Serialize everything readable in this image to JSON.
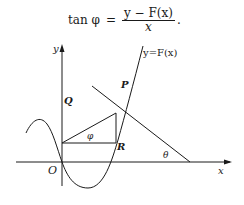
{
  "formula": {
    "lhs": "tan φ",
    "equals": "=",
    "numerator": "y − F(x)",
    "denominator": "x",
    "trailing": "."
  },
  "figure": {
    "axis_labels": {
      "y": "y",
      "x": "x",
      "origin": "O"
    },
    "curve_label": "y=F(x)",
    "point_labels": {
      "P": "P",
      "Q": "Q",
      "R": "R"
    },
    "angle_labels": {
      "phi": "φ",
      "theta": "θ"
    },
    "colors": {
      "stroke": "#1a1a1a",
      "background": "#ffffff"
    }
  }
}
